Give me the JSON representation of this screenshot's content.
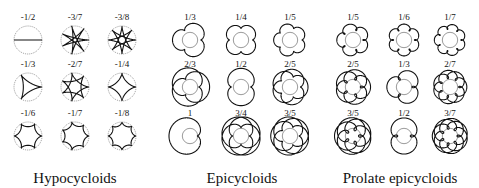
{
  "panels": [
    {
      "caption": "Hypocycloids",
      "type": "hypo",
      "caption_x": 75,
      "cells": [
        {
          "label": "-1/2",
          "p": 1,
          "q": 2
        },
        {
          "label": "-3/7",
          "p": 3,
          "q": 7
        },
        {
          "label": "-3/8",
          "p": 3,
          "q": 8
        },
        {
          "label": "-1/3",
          "p": 1,
          "q": 3
        },
        {
          "label": "-2/7",
          "p": 2,
          "q": 7
        },
        {
          "label": "-1/4",
          "p": 1,
          "q": 4
        },
        {
          "label": "-1/6",
          "p": 1,
          "q": 6
        },
        {
          "label": "-1/7",
          "p": 1,
          "q": 7
        },
        {
          "label": "-1/8",
          "p": 1,
          "q": 8
        }
      ]
    },
    {
      "caption": "Epicycloids",
      "type": "epi",
      "caption_x": 242,
      "cells": [
        {
          "label": "1/3",
          "p": 1,
          "q": 3
        },
        {
          "label": "1/4",
          "p": 1,
          "q": 4
        },
        {
          "label": "1/5",
          "p": 1,
          "q": 5
        },
        {
          "label": "2/3",
          "p": 2,
          "q": 3
        },
        {
          "label": "1/2",
          "p": 1,
          "q": 2
        },
        {
          "label": "2/5",
          "p": 2,
          "q": 5
        },
        {
          "label": "1",
          "p": 1,
          "q": 1
        },
        {
          "label": "3/4",
          "p": 3,
          "q": 4
        },
        {
          "label": "3/5",
          "p": 3,
          "q": 5
        }
      ]
    },
    {
      "caption": "Prolate epicycloids",
      "type": "prolate",
      "caption_x": 400,
      "cells": [
        {
          "label": "1/5",
          "p": 1,
          "q": 5
        },
        {
          "label": "1/6",
          "p": 1,
          "q": 6
        },
        {
          "label": "1/7",
          "p": 1,
          "q": 7
        },
        {
          "label": "2/5",
          "p": 2,
          "q": 5
        },
        {
          "label": "1/3",
          "p": 1,
          "q": 3
        },
        {
          "label": "2/7",
          "p": 2,
          "q": 7
        },
        {
          "label": "3/5",
          "p": 3,
          "q": 5
        },
        {
          "label": "1/2",
          "p": 1,
          "q": 2
        },
        {
          "label": "3/7",
          "p": 3,
          "q": 7
        }
      ]
    }
  ],
  "layout": {
    "col_x": [
      [
        28,
        75,
        122
      ],
      [
        190,
        241,
        290
      ],
      [
        353,
        404,
        450
      ]
    ],
    "row_y": [
      12,
      59,
      108
    ]
  },
  "colors": {
    "stroke": "#111111",
    "guide": "#555555",
    "background": "#ffffff"
  }
}
